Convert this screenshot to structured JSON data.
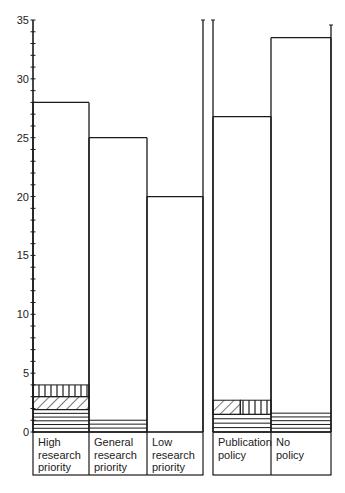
{
  "chart_data": {
    "type": "bar",
    "title": "",
    "xlabel": "",
    "ylabel": "",
    "ylim": [
      0,
      35
    ],
    "grid": false,
    "legend": null,
    "y_ticks": [
      0,
      5,
      10,
      15,
      20,
      25,
      30,
      35
    ],
    "y_minor_tick_step": 1,
    "groups": [
      {
        "name": "group-1",
        "categories": [
          "High research priority",
          "General research priority",
          "Low research priority"
        ]
      },
      {
        "name": "group-2",
        "categories": [
          "Publication policy",
          "No policy"
        ]
      }
    ],
    "categories": [
      "High research priority",
      "General research priority",
      "Low research priority",
      "Publication policy",
      "No policy"
    ],
    "category_labels": [
      [
        "High",
        "research",
        "priority"
      ],
      [
        "General",
        "research",
        "priority"
      ],
      [
        "Low",
        "research",
        "priority"
      ],
      [
        "Publication",
        "policy"
      ],
      [
        "No",
        "policy"
      ]
    ],
    "values": [
      28,
      25,
      20,
      26.8,
      33.5
    ],
    "segments": [
      [
        {
          "pattern": "horizontal-lines",
          "from": 0,
          "to": 1.9
        },
        {
          "pattern": "diagonal-hatch",
          "from": 1.9,
          "to": 3.0
        },
        {
          "pattern": "vertical-lines",
          "from": 3.0,
          "to": 4.0
        }
      ],
      [
        {
          "pattern": "horizontal-lines",
          "from": 0,
          "to": 1.0
        }
      ],
      [],
      [
        {
          "pattern": "horizontal-lines",
          "from": 0,
          "to": 1.5
        },
        {
          "pattern": "diagonal-and-vertical-split",
          "from": 1.5,
          "to": 2.7
        }
      ],
      [
        {
          "pattern": "horizontal-lines",
          "from": 0,
          "to": 1.6
        }
      ]
    ],
    "colors": {
      "stroke": "#1a1a1a",
      "fill": "#ffffff"
    }
  }
}
